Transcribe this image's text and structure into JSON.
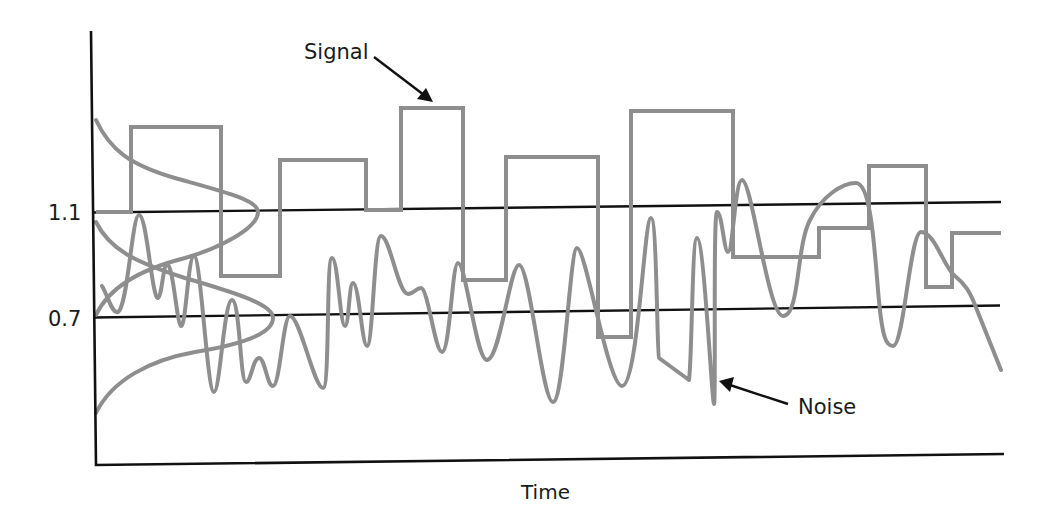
{
  "figure": {
    "type": "diagram"
  },
  "axes": {
    "xlabel": "Time",
    "ylabel": "",
    "y_ticks": [
      {
        "label": "1.1",
        "value": 1.1
      },
      {
        "label": "0.7",
        "value": 0.7
      }
    ]
  },
  "annotations": {
    "signal_label": "Signal",
    "noise_label": "Noise"
  },
  "series": [
    {
      "name": "Signal",
      "style": "step",
      "color": "#8e8e8e"
    },
    {
      "name": "Noise",
      "style": "smooth-oscillation",
      "color": "#8e8e8e"
    },
    {
      "name": "Upper distribution",
      "style": "gaussian",
      "centered_on": "1.1",
      "color": "#8e8e8e"
    },
    {
      "name": "Lower distribution",
      "style": "gaussian",
      "centered_on": "0.7",
      "color": "#8e8e8e"
    }
  ],
  "thresholds": [
    {
      "label": "1.1",
      "color": "#111111"
    },
    {
      "label": "0.7",
      "color": "#111111"
    }
  ],
  "colors": {
    "axis": "#111111",
    "curves": "#8e8e8e",
    "background": "#ffffff"
  }
}
